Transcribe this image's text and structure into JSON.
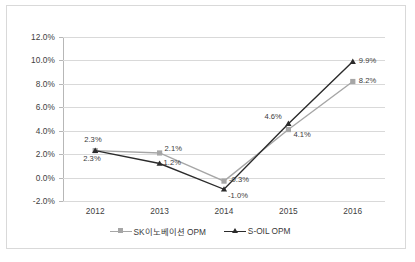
{
  "chart_data": {
    "type": "line",
    "title": "",
    "subtitle": "",
    "xlabel": "",
    "ylabel": "",
    "categories": [
      "2012",
      "2013",
      "2014",
      "2015",
      "2016"
    ],
    "ylim": [
      -2.0,
      12.0
    ],
    "ytick_values": [
      12.0,
      10.0,
      8.0,
      6.0,
      4.0,
      2.0,
      0.0,
      -2.0
    ],
    "ytick_labels": [
      "12.0%",
      "10.0%",
      "8.0%",
      "6.0%",
      "4.0%",
      "2.0%",
      "0.0%",
      "-2.0%"
    ],
    "grid": true,
    "legend_position": "bottom",
    "series": [
      {
        "name": "SK이노베이션 OPM",
        "color": "#a6a6a6",
        "marker": "square",
        "values": [
          2.3,
          2.1,
          -0.3,
          4.1,
          8.2
        ],
        "labels": [
          "2.3%",
          "2.1%",
          "-0.3%",
          "4.1%",
          "8.2%"
        ]
      },
      {
        "name": "S-OIL OPM",
        "color": "#2b2b2b",
        "marker": "triangle",
        "values": [
          2.3,
          1.2,
          -1.0,
          4.6,
          9.9
        ],
        "labels": [
          "2.3%",
          "1.2%",
          "-1.0%",
          "4.6%",
          "9.9%"
        ]
      }
    ]
  },
  "legend": {
    "items": [
      {
        "label": "SK이노베이션 OPM"
      },
      {
        "label": "S-OIL OPM"
      }
    ]
  },
  "colors": {
    "sk_series": "#a6a6a6",
    "soil_series": "#2b2b2b",
    "gridline": "#d9d9d9",
    "axis": "#b7b7b7",
    "text": "#404040",
    "frame": "#d9d9d9",
    "background": "#ffffff"
  }
}
